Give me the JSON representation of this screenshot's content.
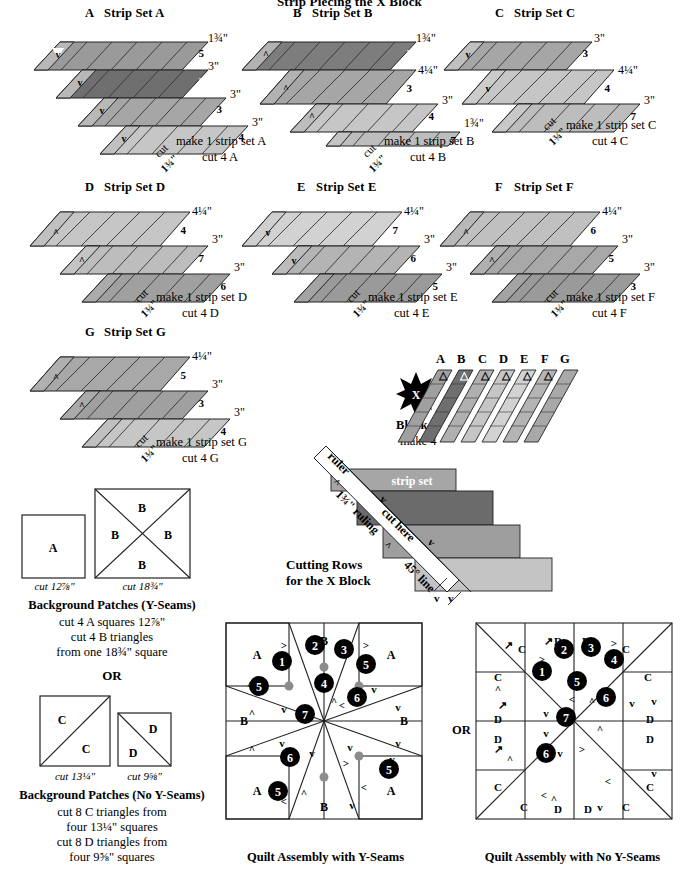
{
  "page": {
    "title": "Strip Piecing the X Block",
    "width": 699,
    "height": 872
  },
  "colors": {
    "f2": "#7a7a7a",
    "f3": "#9e9e9e",
    "f4": "#c9c9c9",
    "f5": "#8e8e8e",
    "f6": "#a8a8a8",
    "f7": "#bdbdbd",
    "outline": "#222222",
    "dot": "#8c8c8c",
    "star": "#000000"
  },
  "strip_sets": [
    {
      "letter": "A",
      "title": "Strip Set A",
      "strips": [
        {
          "fabric": "5",
          "width": "1¾\"",
          "shade": "#9a9a9a"
        },
        {
          "fabric": "2",
          "width": "3\"",
          "shade": "#6f6f6f"
        },
        {
          "fabric": "3",
          "width": "3\"",
          "shade": "#a6a6a6"
        },
        {
          "fabric": "4",
          "width": "3\"",
          "shade": "#c6c6c6"
        }
      ],
      "cut_label": "cut",
      "cut_size": "1¾\"",
      "make_text": "make 1 strip set A",
      "cut_text": "cut 4 A"
    },
    {
      "letter": "B",
      "title": "Strip Set B",
      "strips": [
        {
          "fabric": "2",
          "width": "1¾\"",
          "shade": "#6f6f6f"
        },
        {
          "fabric": "3",
          "width": "4¼\"",
          "shade": "#a6a6a6"
        },
        {
          "fabric": "4",
          "width": "3\"",
          "shade": "#c6c6c6"
        },
        {
          "fabric": "7",
          "width": "1¾\"",
          "shade": "#bdbdbd"
        }
      ],
      "cut_label": "cut",
      "cut_size": "1¾\"",
      "make_text": "make 1 strip set B",
      "cut_text": "cut 4 B"
    },
    {
      "letter": "C",
      "title": "Strip Set C",
      "strips": [
        {
          "fabric": "3",
          "width": "3\"",
          "shade": "#a6a6a6"
        },
        {
          "fabric": "4",
          "width": "4¼\"",
          "shade": "#c6c6c6"
        },
        {
          "fabric": "7",
          "width": "3\"",
          "shade": "#bdbdbd"
        }
      ],
      "cut_label": "cut",
      "cut_size": "1¾\"",
      "make_text": "make 1 strip set C",
      "cut_text": "cut 4 C"
    },
    {
      "letter": "D",
      "title": "Strip Set D",
      "strips": [
        {
          "fabric": "4",
          "width": "4¼\"",
          "shade": "#c6c6c6"
        },
        {
          "fabric": "7",
          "width": "3\"",
          "shade": "#bdbdbd"
        },
        {
          "fabric": "6",
          "width": "3\"",
          "shade": "#a0a0a0"
        }
      ],
      "cut_label": "cut",
      "cut_size": "1¾\"",
      "make_text": "make 1 strip set D",
      "cut_text": "cut 4 D"
    },
    {
      "letter": "E",
      "title": "Strip Set E",
      "strips": [
        {
          "fabric": "7",
          "width": "4¼\"",
          "shade": "#d2d2d2"
        },
        {
          "fabric": "6",
          "width": "3\"",
          "shade": "#b4b4b4"
        },
        {
          "fabric": "5",
          "width": "3\"",
          "shade": "#9a9a9a"
        }
      ],
      "cut_label": "cut",
      "cut_size": "1¾\"",
      "make_text": "make 1 strip set E",
      "cut_text": "cut 4 E"
    },
    {
      "letter": "F",
      "title": "Strip Set F",
      "strips": [
        {
          "fabric": "6",
          "width": "4¼\"",
          "shade": "#c0c0c0"
        },
        {
          "fabric": "5",
          "width": "3\"",
          "shade": "#a8a8a8"
        },
        {
          "fabric": "3",
          "width": "3\"",
          "shade": "#9a9a9a"
        }
      ],
      "cut_label": "cut",
      "cut_size": "1¾\"",
      "make_text": "make 1 strip set F",
      "cut_text": "cut 4 F"
    },
    {
      "letter": "G",
      "title": "Strip Set G",
      "strips": [
        {
          "fabric": "5",
          "width": "4¼\"",
          "shade": "#a8a8a8"
        },
        {
          "fabric": "3",
          "width": "3\"",
          "shade": "#a0a0a0"
        },
        {
          "fabric": "4",
          "width": "3\"",
          "shade": "#c6c6c6"
        }
      ],
      "cut_label": "cut",
      "cut_size": "1¾\"",
      "make_text": "make 1 strip set G",
      "cut_text": "cut 4 G"
    }
  ],
  "block_x": {
    "star_letter": "X",
    "title": "Block X",
    "subtitle": "make 4",
    "column_labels": [
      "A",
      "B",
      "C",
      "D",
      "E",
      "F",
      "G"
    ],
    "column_shades": [
      "#a0a0a0",
      "#6f6f6f",
      "#b0b0b0",
      "#c6c6c6",
      "#d2d2d2",
      "#b4b4b4",
      "#a8a8a8"
    ]
  },
  "cutting_rows": {
    "title_line1": "Cutting Rows",
    "title_line2": "for the X Block",
    "ruler_label": "ruler",
    "ruling_label": "1¾\" ruling",
    "cut_here_label": "cut here",
    "angle_label": "45° line",
    "strip_set_label": "strip set",
    "step_shades": [
      "#a6a6a6",
      "#6b6b6b",
      "#9e9e9e",
      "#c4c4c4"
    ]
  },
  "background_y": {
    "patch_a_letter": "A",
    "patch_a_cut": "cut 12⅞\"",
    "patch_b_letters": [
      "B",
      "B",
      "B",
      "B"
    ],
    "patch_b_cut": "cut 18¾\"",
    "heading": "Background Patches (Y-Seams)",
    "lines": [
      "cut 4 A squares 12⅞\"",
      "cut 4 B triangles",
      "from one 18¾\" square"
    ]
  },
  "or_divider": "OR",
  "background_noy": {
    "patch_c_letters": [
      "C",
      "C"
    ],
    "patch_c_cut": "cut 13¼\"",
    "patch_d_letters": [
      "D",
      "D"
    ],
    "patch_d_cut": "cut 9⅝\"",
    "heading": "Background Patches (No Y-Seams)",
    "lines": [
      "cut 8 C triangles from",
      "four 13¼\" squares",
      "cut 8 D triangles from",
      "four 9⅝\" squares"
    ]
  },
  "assembly_y": {
    "caption": "Quilt Assembly with Y-Seams",
    "step_numbers": [
      "1",
      "2",
      "3",
      "4",
      "5",
      "5",
      "5",
      "6",
      "6",
      "7"
    ],
    "patch_labels": [
      "A",
      "A",
      "A",
      "A",
      "B",
      "B",
      "B",
      "B"
    ]
  },
  "assembly_noy": {
    "or_label": "OR",
    "caption": "Quilt Assembly with No Y-Seams",
    "step_numbers": [
      "1",
      "2",
      "3",
      "4",
      "5",
      "6",
      "6",
      "7"
    ],
    "patch_labels": [
      "C",
      "C",
      "C",
      "C",
      "C",
      "C",
      "C",
      "C",
      "D",
      "D",
      "D",
      "D",
      "D",
      "D",
      "D",
      "D"
    ]
  }
}
